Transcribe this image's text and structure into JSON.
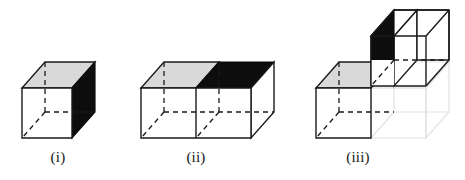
{
  "figure": {
    "background_color": "#ffffff",
    "line_color": "#1a1a1a",
    "shaded_top_color": "#d9d9d9",
    "black_face_color": "#0d0d0d",
    "white_face_color": "#ffffff",
    "ghost_line_color": "#e2e2e2",
    "panels": [
      {
        "id": "i",
        "caption": "(i)",
        "description": "Single unit cube drawn in oblique projection with a light grey top face, a solid black right face, a white front face and dashed hidden edges.",
        "faces": {
          "top": "grey",
          "right": "black",
          "front": "white",
          "hidden_edges": "dashed"
        },
        "cube_count": 1
      },
      {
        "id": "ii",
        "caption": "(ii)",
        "description": "Two unit cubes joined side by side forming a 2x1x1 block. The near top face is light grey, the far top face is solid black, front faces are white and hidden edges are dashed.",
        "faces": {
          "top_left": "grey",
          "top_right": "black",
          "front": "white",
          "hidden_edges": "dashed"
        },
        "cube_count": 2
      },
      {
        "id": "iii",
        "caption": "(iii)",
        "description": "The 2x1x1 block with its rear cube translated up and to the right. The exposed cut face of the displaced cube is solid black, the remaining top face of the lower cube is light grey, and a faint outline marks the cube's original position.",
        "faces": {
          "lower_top": "grey",
          "displaced_cut": "black",
          "front": "white",
          "hidden_edges": "dashed",
          "ghost_outline": "faint grey"
        },
        "cube_count": 2
      }
    ]
  }
}
